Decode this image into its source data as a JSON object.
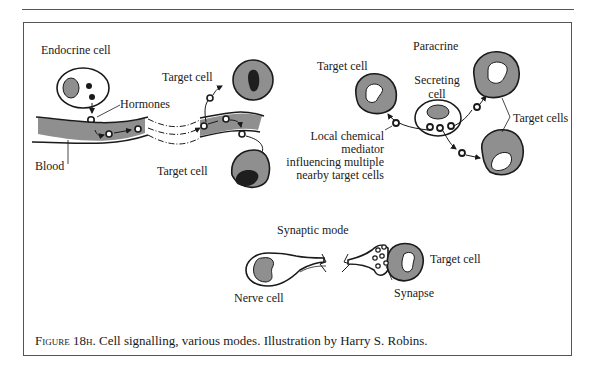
{
  "figure": {
    "caption_label": "Figure 18h.",
    "caption_text": " Cell signalling, various modes. Illustration by Harry S. Robins."
  },
  "panels": {
    "endocrine": {
      "title": "Endocrine cell",
      "hormones_label": "Hormones",
      "blood_label": "Blood",
      "target_top_label": "Target cell",
      "target_bottom_label": "Target cell"
    },
    "paracrine": {
      "title": "Paracrine",
      "target_left_label": "Target cell",
      "secreting_label_1": "Secreting",
      "secreting_label_2": "cell",
      "target_right_label": "Target cells",
      "mediator_lines": [
        "Local chemical",
        "mediator",
        "influencing multiple",
        "nearby target cells"
      ]
    },
    "synaptic": {
      "title": "Synaptic mode",
      "nerve_label": "Nerve cell",
      "target_label": "Target cell",
      "synapse_label": "Synapse"
    }
  },
  "colors": {
    "cell_fill": "#8f8f8f",
    "nucleus_dark": "#1e1e1e",
    "stroke": "#1a1a1a",
    "frame": "#555555"
  }
}
